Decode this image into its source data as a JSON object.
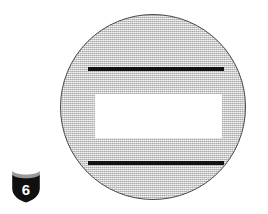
{
  "diagram": {
    "sign": {
      "name": "circular-road-sign",
      "shape": "circle",
      "fill_color": "#c9c9c9",
      "outline_color": "#4a4a4a",
      "elements": [
        {
          "name": "top-bar",
          "type": "horizontal-bar",
          "color": "#131313"
        },
        {
          "name": "center-panel",
          "type": "rectangle",
          "color": "#ffffff"
        },
        {
          "name": "bottom-bar",
          "type": "horizontal-bar",
          "color": "#131313"
        }
      ]
    },
    "route_marker": {
      "name": "interstate-shield",
      "type": "interstate-shield",
      "route_number": "6",
      "body_color": "#101010",
      "crown_color": "#9a9a9a",
      "number_color": "#ffffff"
    }
  }
}
